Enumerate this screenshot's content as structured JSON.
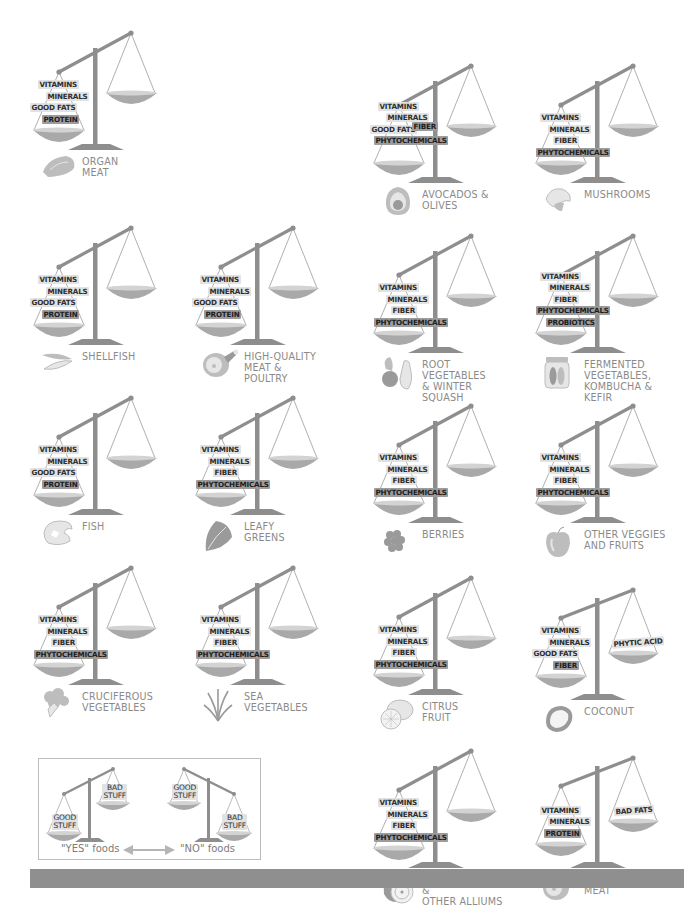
{
  "colors": {
    "scale_gray": "#8e8e8e",
    "pan_fill": "#a9a9a9",
    "pan_rim": "#d3d3d3",
    "label_gray": "#8a8a8a",
    "tag_bg": "#e2e2e2",
    "tag_dark_bg": "#9c9c9c",
    "bottom_bar": "#8f8f8f"
  },
  "scales": [
    {
      "id": "organ-meat",
      "label": "ORGAN\nMEAT",
      "icon": "organ-meat-icon",
      "good": [
        "VITAMINS",
        "MINERALS",
        "GOOD FATS",
        "PROTEIN"
      ],
      "bad": []
    },
    {
      "id": "avocados-olives",
      "label": "AVOCADOS &\nOLIVES",
      "icon": "avocado-icon",
      "good": [
        "VITAMINS",
        "MINERALS",
        "GOOD FATS",
        "FIBER",
        "PHYTOCHEMICALS"
      ],
      "bad": []
    },
    {
      "id": "mushrooms",
      "label": "MUSHROOMS",
      "icon": "mushroom-icon",
      "good": [
        "VITAMINS",
        "MINERALS",
        "FIBER",
        "PHYTOCHEMICALS"
      ],
      "bad": []
    },
    {
      "id": "shellfish",
      "label": "SHELLFISH",
      "icon": "shellfish-icon",
      "good": [
        "VITAMINS",
        "MINERALS",
        "GOOD FATS",
        "PROTEIN"
      ],
      "bad": []
    },
    {
      "id": "high-quality-meat",
      "label": "HIGH-QUALITY\nMEAT &\nPOULTRY",
      "icon": "ham-icon",
      "good": [
        "VITAMINS",
        "MINERALS",
        "GOOD FATS",
        "PROTEIN"
      ],
      "bad": []
    },
    {
      "id": "root-vegetables",
      "label": "ROOT VEGETABLES\n& WINTER\nSQUASH",
      "icon": "root-vegetable-icon",
      "good": [
        "VITAMINS",
        "MINERALS",
        "FIBER",
        "PHYTOCHEMICALS"
      ],
      "bad": []
    },
    {
      "id": "fermented",
      "label": "FERMENTED\nVEGETABLES,\nKOMBUCHA &\nKEFIR",
      "icon": "pickle-jar-icon",
      "good": [
        "VITAMINS",
        "MINERALS",
        "FIBER",
        "PHYTOCHEMICALS",
        "PROBIOTICS"
      ],
      "bad": []
    },
    {
      "id": "fish",
      "label": "FISH",
      "icon": "fish-steak-icon",
      "good": [
        "VITAMINS",
        "MINERALS",
        "GOOD FATS",
        "PROTEIN"
      ],
      "bad": []
    },
    {
      "id": "leafy-greens",
      "label": "LEAFY\nGREENS",
      "icon": "leafy-greens-icon",
      "good": [
        "VITAMINS",
        "MINERALS",
        "FIBER",
        "PHYTOCHEMICALS"
      ],
      "bad": []
    },
    {
      "id": "berries",
      "label": "BERRIES",
      "icon": "berry-icon",
      "good": [
        "VITAMINS",
        "MINERALS",
        "FIBER",
        "PHYTOCHEMICALS"
      ],
      "bad": []
    },
    {
      "id": "other-veggies-fruits",
      "label": "OTHER VEGGIES\nAND FRUITS",
      "icon": "apple-icon",
      "good": [
        "VITAMINS",
        "MINERALS",
        "FIBER",
        "PHYTOCHEMICALS"
      ],
      "bad": []
    },
    {
      "id": "cruciferous",
      "label": "CRUCIFEROUS\nVEGETABLES",
      "icon": "broccoli-icon",
      "good": [
        "VITAMINS",
        "MINERALS",
        "FIBER",
        "PHYTOCHEMICALS"
      ],
      "bad": []
    },
    {
      "id": "sea-vegetables",
      "label": "SEA\nVEGETABLES",
      "icon": "seaweed-icon",
      "good": [
        "VITAMINS",
        "MINERALS",
        "FIBER",
        "PHYTOCHEMICALS"
      ],
      "bad": []
    },
    {
      "id": "citrus",
      "label": "CITRUS\nFRUIT",
      "icon": "lemon-icon",
      "good": [
        "VITAMINS",
        "MINERALS",
        "FIBER",
        "PHYTOCHEMICALS"
      ],
      "bad": []
    },
    {
      "id": "coconut",
      "label": "COCONUT",
      "icon": "coconut-icon",
      "good": [
        "VITAMINS",
        "MINERALS",
        "GOOD FATS",
        "FIBER"
      ],
      "bad": [
        "PHYTIC ACID"
      ]
    },
    {
      "id": "onions-garlic",
      "label": "ONIONS, GARLIC &\nOTHER ALLIUMS",
      "icon": "onion-icon",
      "good": [
        "VITAMINS",
        "MINERALS",
        "FIBER",
        "PHYTOCHEMICALS"
      ],
      "bad": []
    },
    {
      "id": "conventional-meat",
      "label": "CONVENTIONAL\nMEAT",
      "icon": "ham-icon",
      "good": [
        "VITAMINS",
        "MINERALS",
        "PROTEIN"
      ],
      "bad": [
        "BAD FATS"
      ]
    }
  ],
  "legend": {
    "yes_scale": {
      "left_pan": "GOOD\nSTUFF",
      "right_pan": "BAD\nSTUFF"
    },
    "no_scale": {
      "left_pan": "GOOD\nSTUFF",
      "right_pan": "BAD\nSTUFF"
    },
    "yes_caption": "\"YES\" foods",
    "no_caption": "\"NO\" foods",
    "arrow": "double-arrow-icon"
  }
}
